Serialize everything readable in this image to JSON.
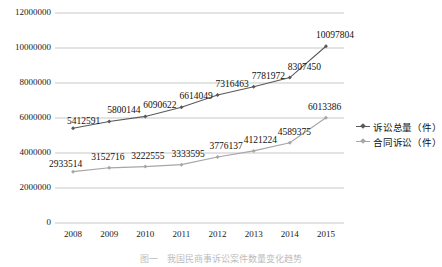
{
  "chart_data": {
    "type": "line",
    "title": "",
    "xlabel": "",
    "ylabel": "",
    "categories": [
      "2008",
      "2009",
      "2010",
      "2011",
      "2012",
      "2013",
      "2014",
      "2015"
    ],
    "ylim": [
      0,
      12000000
    ],
    "ytick_labels": [
      "12000000",
      "10000000",
      "8000000",
      "6000000",
      "4000000",
      "2000000",
      "0"
    ],
    "ytick_values": [
      12000000,
      10000000,
      8000000,
      6000000,
      4000000,
      2000000,
      0
    ],
    "grid": true,
    "legend_position": "right",
    "series": [
      {
        "name": "诉讼总量（件）",
        "color": "#595959",
        "values": [
          5412591,
          5800144,
          6090622,
          6614049,
          7316463,
          7781972,
          8307450,
          10097804
        ],
        "labels": [
          "5412591",
          "5800144",
          "6090622",
          "6614049",
          "7316463",
          "7781972",
          "8307450",
          "10097804"
        ]
      },
      {
        "name": "合同诉讼（件）",
        "color": "#a6a6a6",
        "values": [
          2933514,
          3152716,
          3222555,
          3333595,
          3776137,
          4121224,
          4589375,
          6013386
        ],
        "labels": [
          "2933514",
          "3152716",
          "3222555",
          "3333595",
          "3776137",
          "4121224",
          "4589375",
          "6013386"
        ]
      }
    ]
  },
  "legend": {
    "items": [
      {
        "label": "诉讼总量（件）",
        "color": "#595959"
      },
      {
        "label": "合同诉讼（件）",
        "color": "#a6a6a6"
      }
    ]
  },
  "caption": {
    "text": "图一　我国民商事诉讼案件数量变化趋势"
  }
}
